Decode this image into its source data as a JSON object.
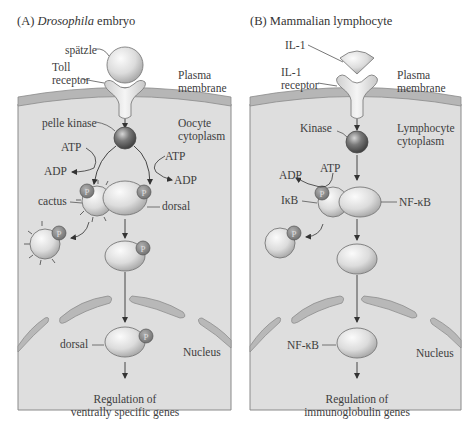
{
  "colors": {
    "cytoplasm": "#dedede",
    "membrane": "#b4b4b4",
    "border": "#8a8a8a",
    "nuclear_envelope": "#b8b8b8",
    "protein_light": "#e6e6e6",
    "kinase_dark": "#6e6e6e",
    "phosphate": "#8c8c8c",
    "text": "#3d3d3d"
  },
  "panel_a": {
    "title_prefix": "(A) ",
    "title_italic": "Drosophila",
    "title_suffix": " embryo",
    "ligand": "spätzle",
    "receptor_line1": "Toll",
    "receptor_line2": "receptor",
    "membrane_line1": "Plasma",
    "membrane_line2": "membrane",
    "kinase": "pelle kinase",
    "cytoplasm_line1": "Oocyte",
    "cytoplasm_line2": "cytoplasm",
    "atp_left": "ATP",
    "adp_left": "ADP",
    "atp_right": "ATP",
    "adp_right": "ADP",
    "inhibitor": "cactus",
    "factor": "dorsal",
    "phosphate": "P",
    "nuclear_factor": "dorsal",
    "nucleus": "Nucleus",
    "outcome_line1": "Regulation of",
    "outcome_line2": "ventrally specific genes"
  },
  "panel_b": {
    "title": "(B) Mammalian lymphocyte",
    "ligand": "IL-1",
    "receptor_line1": "IL-1",
    "receptor_line2": "receptor",
    "membrane_line1": "Plasma",
    "membrane_line2": "membrane",
    "kinase": "Kinase",
    "cytoplasm_line1": "Lymphocyte",
    "cytoplasm_line2": "cytoplasm",
    "adp": "ADP",
    "atp": "ATP",
    "inhibitor": "IκB",
    "factor": "NF-κB",
    "phosphate": "P",
    "nuclear_factor": "NF-κB",
    "nucleus": "Nucleus",
    "outcome_line1": "Regulation of",
    "outcome_line2": "immunoglobulin genes"
  }
}
